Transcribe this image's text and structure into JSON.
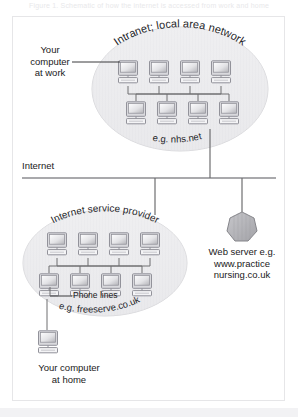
{
  "page": {
    "top_caption": "Figure 1. Schematic of how the internet is accessed from work and home",
    "bottom_strip": ""
  },
  "diagram": {
    "type": "network-topology",
    "divider_label": "Internet",
    "zones": [
      {
        "id": "intranet",
        "arc_label": "Intranet; local area network",
        "example_label": "e.g. nhs.net",
        "computer_rows": [
          4,
          4
        ]
      },
      {
        "id": "isp",
        "arc_label": "Internet service provider",
        "example_label": "e.g. freeserve.co.uk",
        "computer_rows": [
          4,
          4
        ]
      }
    ],
    "callouts": [
      {
        "id": "work-computer",
        "text": "Your\ncomputer\nat work"
      },
      {
        "id": "phone-lines",
        "text": "Phone lines"
      },
      {
        "id": "home-computer",
        "text": "Your computer\nat home"
      },
      {
        "id": "web-server",
        "text": "Web server e.g.\nwww.practice\nnursing.co.uk"
      }
    ],
    "colors": {
      "line": "#6e6e70",
      "text": "#1a1a1a",
      "ellipse_fill": "#ededef",
      "ellipse_stroke": "#d6d6d8",
      "monitor_frame": "#9b9b9e",
      "monitor_screen_light": "#fbfbfc",
      "monitor_screen_dark": "#b9b9bd",
      "server_fill": "#b2b2b6",
      "server_stroke": "#85858a",
      "frame_border": "#e6e6e8"
    }
  }
}
